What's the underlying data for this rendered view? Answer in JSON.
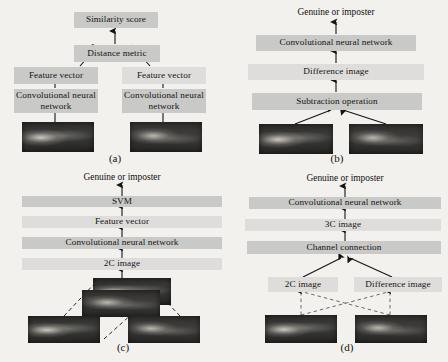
{
  "figure": {
    "background_color": "#f2f1ee",
    "box_color": "#c9c9c7",
    "box_color_light": "#dedddb",
    "arrow_color": "#141414",
    "panels": [
      {
        "id": "a",
        "caption": "(a)",
        "nodes": [
          {
            "name": "similarity-score",
            "label": "Similarity score"
          },
          {
            "name": "distance-metric",
            "label": "Distance metric"
          },
          {
            "name": "feature-vector-left",
            "label": "Feature vector"
          },
          {
            "name": "feature-vector-right",
            "label": "Feature vector"
          },
          {
            "name": "cnn-left",
            "label": "Convolutional neural network"
          },
          {
            "name": "cnn-right",
            "label": "Convolutional neural network"
          },
          {
            "name": "vein-image-left",
            "label": ""
          },
          {
            "name": "vein-image-right",
            "label": ""
          }
        ]
      },
      {
        "id": "b",
        "caption": "(b)",
        "nodes": [
          {
            "name": "genuine-or-imposter",
            "label": "Genuine or imposter"
          },
          {
            "name": "cnn",
            "label": "Convolutional neural network"
          },
          {
            "name": "difference-image",
            "label": "Difference image"
          },
          {
            "name": "subtraction-operation",
            "label": "Subtraction operation"
          },
          {
            "name": "vein-image-left",
            "label": ""
          },
          {
            "name": "vein-image-right",
            "label": ""
          }
        ]
      },
      {
        "id": "c",
        "caption": "(c)",
        "nodes": [
          {
            "name": "genuine-or-imposter",
            "label": "Genuine or imposter"
          },
          {
            "name": "svm",
            "label": "SVM"
          },
          {
            "name": "feature-vector",
            "label": "Feature vector"
          },
          {
            "name": "cnn",
            "label": "Convolutional neural network"
          },
          {
            "name": "two-channel-image",
            "label": "2C image"
          },
          {
            "name": "stacked-image-top",
            "label": ""
          },
          {
            "name": "stacked-image-bottom",
            "label": ""
          },
          {
            "name": "vein-image-left",
            "label": ""
          },
          {
            "name": "vein-image-right",
            "label": ""
          }
        ]
      },
      {
        "id": "d",
        "caption": "(d)",
        "nodes": [
          {
            "name": "genuine-or-imposter",
            "label": "Genuine or imposter"
          },
          {
            "name": "cnn",
            "label": "Convolutional neural network"
          },
          {
            "name": "three-channel-image",
            "label": "3C image"
          },
          {
            "name": "channel-connection",
            "label": "Channel connection"
          },
          {
            "name": "two-channel-image",
            "label": "2C image"
          },
          {
            "name": "difference-image",
            "label": "Difference image"
          },
          {
            "name": "vein-image-left",
            "label": ""
          },
          {
            "name": "vein-image-right",
            "label": ""
          }
        ]
      }
    ]
  }
}
